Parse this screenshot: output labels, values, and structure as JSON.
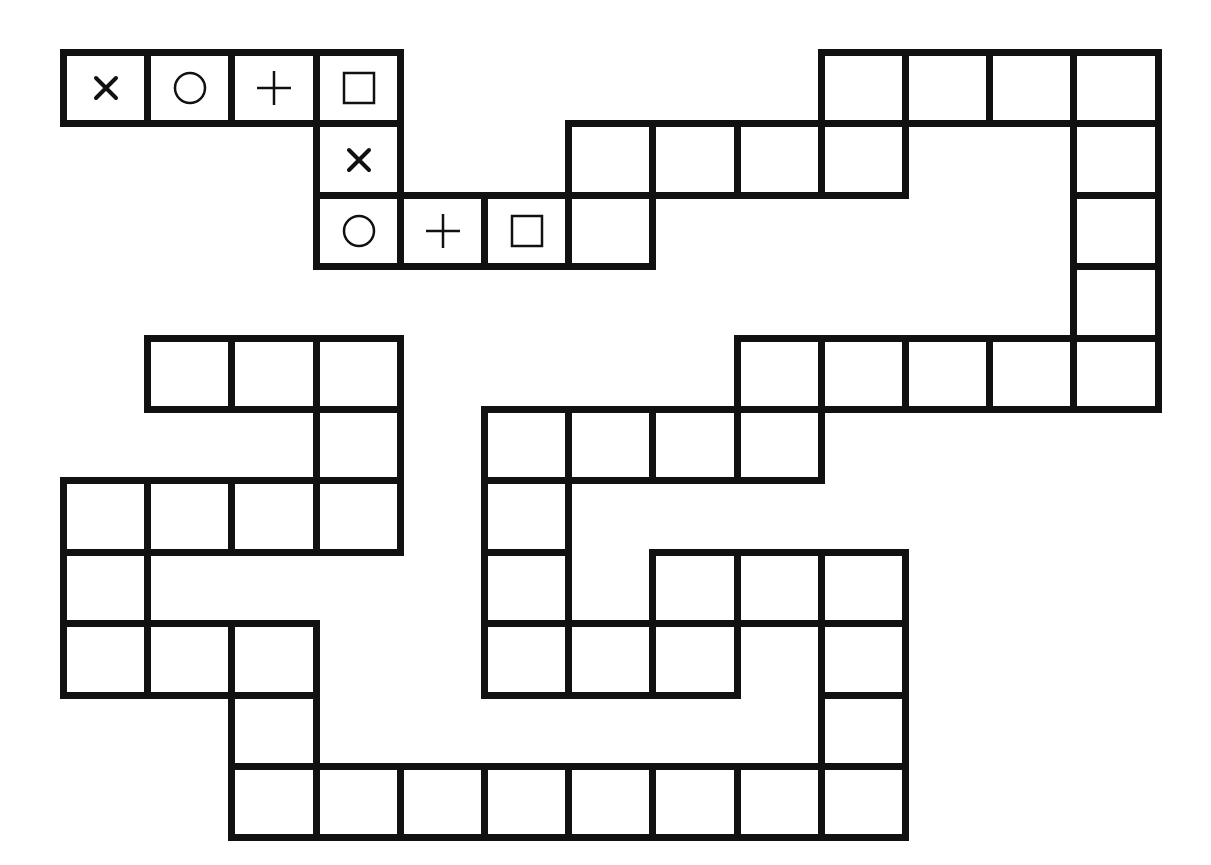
{
  "board": {
    "origin": {
      "x": 60,
      "y": 49
    },
    "cell_w": 84.2,
    "cell_h": 71.4,
    "line_color": "#111111",
    "background": "#ffffff",
    "cells": [
      {
        "col": 0,
        "row": 0,
        "symbol": "cross"
      },
      {
        "col": 1,
        "row": 0,
        "symbol": "circle"
      },
      {
        "col": 2,
        "row": 0,
        "symbol": "plus"
      },
      {
        "col": 3,
        "row": 0,
        "symbol": "square"
      },
      {
        "col": 3,
        "row": 1,
        "symbol": "cross"
      },
      {
        "col": 3,
        "row": 2,
        "symbol": "circle"
      },
      {
        "col": 4,
        "row": 2,
        "symbol": "plus"
      },
      {
        "col": 5,
        "row": 2,
        "symbol": "square"
      },
      {
        "col": 6,
        "row": 2,
        "symbol": ""
      },
      {
        "col": 6,
        "row": 1,
        "symbol": ""
      },
      {
        "col": 7,
        "row": 1,
        "symbol": ""
      },
      {
        "col": 8,
        "row": 1,
        "symbol": ""
      },
      {
        "col": 9,
        "row": 1,
        "symbol": ""
      },
      {
        "col": 9,
        "row": 0,
        "symbol": ""
      },
      {
        "col": 10,
        "row": 0,
        "symbol": ""
      },
      {
        "col": 11,
        "row": 0,
        "symbol": ""
      },
      {
        "col": 12,
        "row": 0,
        "symbol": ""
      },
      {
        "col": 12,
        "row": 1,
        "symbol": ""
      },
      {
        "col": 12,
        "row": 2,
        "symbol": ""
      },
      {
        "col": 12,
        "row": 3,
        "symbol": ""
      },
      {
        "col": 12,
        "row": 4,
        "symbol": ""
      },
      {
        "col": 11,
        "row": 4,
        "symbol": ""
      },
      {
        "col": 10,
        "row": 4,
        "symbol": ""
      },
      {
        "col": 9,
        "row": 4,
        "symbol": ""
      },
      {
        "col": 8,
        "row": 4,
        "symbol": ""
      },
      {
        "col": 8,
        "row": 5,
        "symbol": ""
      },
      {
        "col": 7,
        "row": 5,
        "symbol": ""
      },
      {
        "col": 6,
        "row": 5,
        "symbol": ""
      },
      {
        "col": 5,
        "row": 5,
        "symbol": ""
      },
      {
        "col": 5,
        "row": 6,
        "symbol": ""
      },
      {
        "col": 5,
        "row": 7,
        "symbol": ""
      },
      {
        "col": 5,
        "row": 8,
        "symbol": ""
      },
      {
        "col": 6,
        "row": 8,
        "symbol": ""
      },
      {
        "col": 7,
        "row": 8,
        "symbol": ""
      },
      {
        "col": 7,
        "row": 7,
        "symbol": ""
      },
      {
        "col": 8,
        "row": 7,
        "symbol": ""
      },
      {
        "col": 9,
        "row": 7,
        "symbol": ""
      },
      {
        "col": 9,
        "row": 8,
        "symbol": ""
      },
      {
        "col": 9,
        "row": 9,
        "symbol": ""
      },
      {
        "col": 9,
        "row": 10,
        "symbol": ""
      },
      {
        "col": 8,
        "row": 10,
        "symbol": ""
      },
      {
        "col": 7,
        "row": 10,
        "symbol": ""
      },
      {
        "col": 6,
        "row": 10,
        "symbol": ""
      },
      {
        "col": 5,
        "row": 10,
        "symbol": ""
      },
      {
        "col": 4,
        "row": 10,
        "symbol": ""
      },
      {
        "col": 3,
        "row": 10,
        "symbol": ""
      },
      {
        "col": 2,
        "row": 10,
        "symbol": ""
      },
      {
        "col": 2,
        "row": 9,
        "symbol": ""
      },
      {
        "col": 2,
        "row": 8,
        "symbol": ""
      },
      {
        "col": 1,
        "row": 8,
        "symbol": ""
      },
      {
        "col": 0,
        "row": 8,
        "symbol": ""
      },
      {
        "col": 0,
        "row": 7,
        "symbol": ""
      },
      {
        "col": 0,
        "row": 6,
        "symbol": ""
      },
      {
        "col": 1,
        "row": 6,
        "symbol": ""
      },
      {
        "col": 2,
        "row": 6,
        "symbol": ""
      },
      {
        "col": 3,
        "row": 6,
        "symbol": ""
      },
      {
        "col": 3,
        "row": 5,
        "symbol": ""
      },
      {
        "col": 3,
        "row": 4,
        "symbol": ""
      },
      {
        "col": 2,
        "row": 4,
        "symbol": ""
      },
      {
        "col": 1,
        "row": 4,
        "symbol": ""
      }
    ]
  },
  "symbols": {
    "cross": "cross-icon",
    "circle": "circle-icon",
    "plus": "plus-icon",
    "square": "square-icon"
  }
}
